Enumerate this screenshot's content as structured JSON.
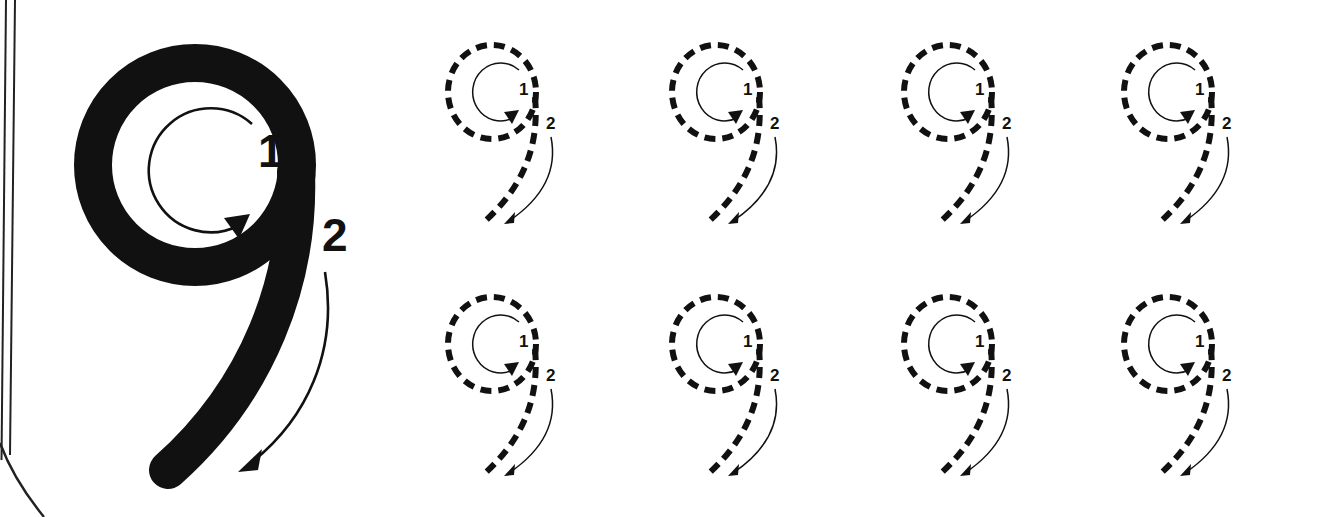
{
  "worksheet": {
    "title": "Number 9 handwriting tracing worksheet",
    "glyph": "9",
    "background_color": "#ffffff",
    "ink_color": "#111111",
    "page_border": {
      "name": "page-edge-rules",
      "line_color": "#222222",
      "line_count": 2,
      "description": "two thin slanted rule lines along the left page edge plus a curved corner line at bottom-left"
    },
    "exemplar": {
      "name": "solid-nine-exemplar",
      "glyph": "9",
      "style": "solid",
      "stroke_labels": [
        {
          "text": "1",
          "stroke": "circle",
          "direction": "clockwise"
        },
        {
          "text": "2",
          "stroke": "tail",
          "direction": "down-left"
        }
      ]
    },
    "practice": {
      "name": "dashed-tracing-grid",
      "rows": 2,
      "columns": 4,
      "total": 8,
      "style": "dashed",
      "items": [
        {
          "glyph": "9",
          "row": 1,
          "column": 1,
          "labels": [
            "1",
            "2"
          ]
        },
        {
          "glyph": "9",
          "row": 1,
          "column": 2,
          "labels": [
            "1",
            "2"
          ]
        },
        {
          "glyph": "9",
          "row": 1,
          "column": 3,
          "labels": [
            "1",
            "2"
          ]
        },
        {
          "glyph": "9",
          "row": 1,
          "column": 4,
          "labels": [
            "1",
            "2"
          ]
        },
        {
          "glyph": "9",
          "row": 2,
          "column": 1,
          "labels": [
            "1",
            "2"
          ]
        },
        {
          "glyph": "9",
          "row": 2,
          "column": 2,
          "labels": [
            "1",
            "2"
          ]
        },
        {
          "glyph": "9",
          "row": 2,
          "column": 3,
          "labels": [
            "1",
            "2"
          ]
        },
        {
          "glyph": "9",
          "row": 2,
          "column": 4,
          "labels": [
            "1",
            "2"
          ]
        }
      ]
    },
    "labels": {
      "stroke_one": "1",
      "stroke_two": "2"
    }
  }
}
